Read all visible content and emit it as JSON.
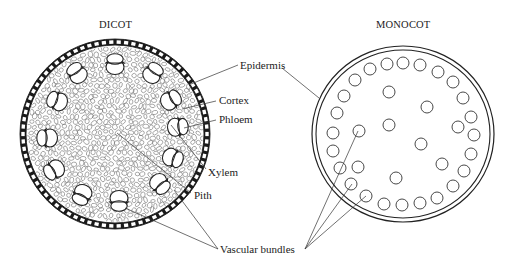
{
  "diagram": {
    "titles": {
      "dicot": "DICOT",
      "monocot": "MONOCOT"
    },
    "labels": {
      "epidermis": "Epidermis",
      "cortex": "Cortex",
      "phloem": "Phloem",
      "xylem": "Xylem",
      "pith": "Pith",
      "vascular_bundles": "Vascular bundles"
    },
    "colors": {
      "line": "#222222",
      "background": "#ffffff",
      "cell": "#6b6b6b"
    },
    "dicot": {
      "center": [
        115,
        134
      ],
      "outer_radius": 95,
      "epidermis_thickness": 6,
      "vascular_bundles": [
        {
          "x": 115,
          "y": 64,
          "angle": 0
        },
        {
          "x": 77,
          "y": 73,
          "angle": -35
        },
        {
          "x": 153,
          "y": 73,
          "angle": 35
        },
        {
          "x": 57,
          "y": 101,
          "angle": -70
        },
        {
          "x": 171,
          "y": 100,
          "angle": 60
        },
        {
          "x": 47,
          "y": 138,
          "angle": -90
        },
        {
          "x": 178,
          "y": 127,
          "angle": 85
        },
        {
          "x": 54,
          "y": 170,
          "angle": -120
        },
        {
          "x": 173,
          "y": 158,
          "angle": 110
        },
        {
          "x": 82,
          "y": 195,
          "angle": -155
        },
        {
          "x": 160,
          "y": 184,
          "angle": 140
        },
        {
          "x": 119,
          "y": 201,
          "angle": 180
        }
      ]
    },
    "monocot": {
      "center": [
        403,
        134
      ],
      "outer_radius_x": 91,
      "outer_radius_y": 88,
      "ring_gap": 4,
      "bundle_radius": 6,
      "bundles": [
        [
          387,
          64
        ],
        [
          403,
          63
        ],
        [
          420,
          65
        ],
        [
          438,
          72
        ],
        [
          453,
          82
        ],
        [
          463,
          98
        ],
        [
          471,
          117
        ],
        [
          474,
          135
        ],
        [
          471,
          154
        ],
        [
          464,
          171
        ],
        [
          453,
          186
        ],
        [
          437,
          198
        ],
        [
          420,
          203
        ],
        [
          402,
          205
        ],
        [
          384,
          204
        ],
        [
          366,
          196
        ],
        [
          351,
          184
        ],
        [
          340,
          168
        ],
        [
          333,
          151
        ],
        [
          333,
          133
        ],
        [
          337,
          113
        ],
        [
          344,
          96
        ],
        [
          355,
          80
        ],
        [
          370,
          69
        ],
        [
          389,
          92
        ],
        [
          427,
          107
        ],
        [
          389,
          125
        ],
        [
          458,
          127
        ],
        [
          421,
          144
        ],
        [
          442,
          164
        ],
        [
          359,
          131
        ],
        [
          358,
          167
        ],
        [
          396,
          178
        ]
      ]
    }
  }
}
